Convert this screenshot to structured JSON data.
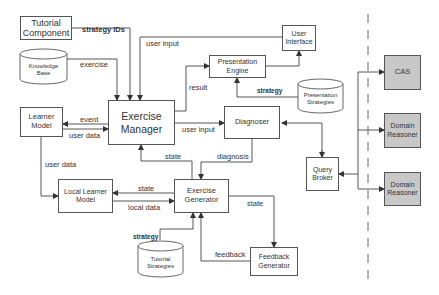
{
  "diagram": {
    "components": {
      "tutorial_component": "Tutorial Component",
      "knowledge_base": "Knowledge Base",
      "learner_model": "Learner Model",
      "exercise_manager": "Exercise Manager",
      "user_interface": "User Interface",
      "presentation_engine": "Presentation Engine",
      "presentation_strategies": "Presentation Strategies",
      "diagnoser": "Diagnoser",
      "query_broker": "Query Broker",
      "local_learner_model": "Local Learner Model",
      "exercise_generator": "Exercise Generator",
      "tutorial_strategies": "Tutorial Strategies",
      "feedback_generator": "Feedback Generator",
      "cas": "CAS",
      "domain_reasoner_1": "Domain Reasoner",
      "domain_reasoner_2": "Domain Reasoner"
    },
    "edge_labels": {
      "strategy_ids": "strategy IDs",
      "user_input_top": "user input",
      "exercise": "exercise",
      "result": "result",
      "strategy_presentation": "strategy",
      "event": "event",
      "user_data_lm": "user data",
      "user_input_diag": "user input",
      "user_data_down": "user data",
      "state_up": "state",
      "diagnosis": "diagnosis",
      "state_local": "state",
      "local_data": "local data",
      "state_feedback": "state",
      "strategy_tutorial": "strategy",
      "feedback": "feedback"
    },
    "colors": {
      "line": "#444444",
      "box_border": "#555555",
      "external_fill": "#c8c8c8"
    }
  }
}
